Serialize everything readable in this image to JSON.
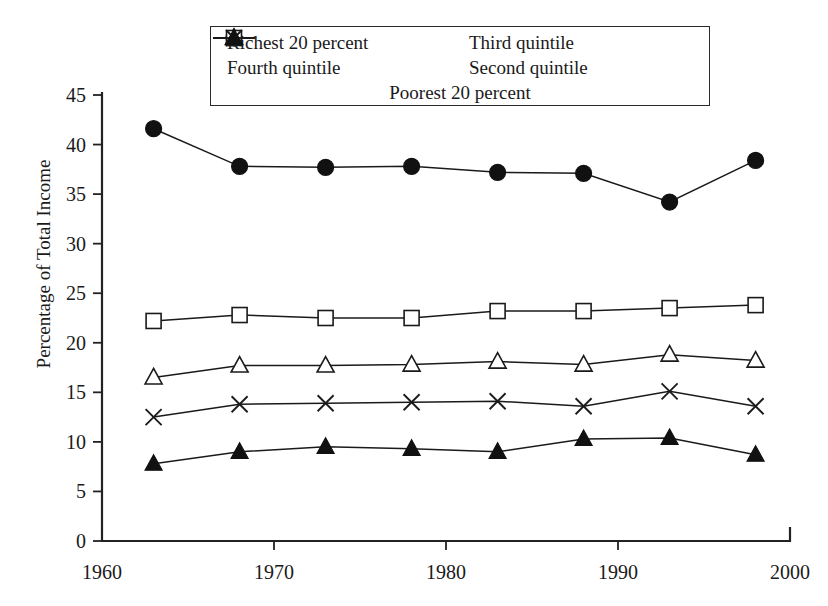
{
  "chart_data": {
    "type": "line",
    "title": "",
    "xlabel": "",
    "ylabel": "Percentage of Total Income",
    "xlim": [
      1960,
      2000
    ],
    "ylim": [
      0,
      45
    ],
    "xticks": [
      1960,
      1970,
      1980,
      1990,
      2000
    ],
    "yticks": [
      0,
      5,
      10,
      15,
      20,
      25,
      30,
      35,
      40,
      45
    ],
    "grid": false,
    "legend_position": "top-center",
    "x": [
      1963,
      1968,
      1973,
      1978,
      1983,
      1988,
      1993,
      1998
    ],
    "series": [
      {
        "name": "Richest 20 percent",
        "marker": "filled-circle",
        "values": [
          41.6,
          37.8,
          37.7,
          37.8,
          37.2,
          37.1,
          34.2,
          38.4
        ]
      },
      {
        "name": "Fourth quintile",
        "marker": "open-square",
        "values": [
          22.2,
          22.8,
          22.5,
          22.5,
          23.2,
          23.2,
          23.5,
          23.8
        ]
      },
      {
        "name": "Third quintile",
        "marker": "open-triangle",
        "values": [
          16.5,
          17.7,
          17.7,
          17.8,
          18.1,
          17.8,
          18.8,
          18.2
        ]
      },
      {
        "name": "Second quintile",
        "marker": "cross-x",
        "values": [
          12.5,
          13.8,
          13.9,
          14.0,
          14.1,
          13.6,
          15.1,
          13.6
        ]
      },
      {
        "name": "Poorest 20 percent",
        "marker": "filled-triangle",
        "values": [
          7.8,
          9.0,
          9.5,
          9.3,
          9.0,
          10.3,
          10.4,
          8.7
        ]
      }
    ]
  },
  "legend": {
    "rows": [
      [
        {
          "label": "Richest 20 percent",
          "marker": "filled-circle"
        },
        {
          "label": "Third quintile",
          "marker": "open-triangle"
        }
      ],
      [
        {
          "label": "Fourth quintile",
          "marker": "open-square"
        },
        {
          "label": "Second quintile",
          "marker": "cross-x"
        }
      ],
      [
        {
          "label": "Poorest 20 percent",
          "marker": "filled-triangle"
        }
      ]
    ]
  },
  "colors": {
    "ink": "#1a1a1a",
    "background": "#ffffff"
  }
}
